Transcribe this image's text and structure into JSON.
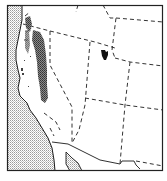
{
  "map": {
    "type": "species range map",
    "region": "Western United States",
    "colors": {
      "frame": "#222222",
      "land": "#ffffff",
      "ocean_stipple": "#9a9a9a",
      "state_border": "#333333",
      "coastline": "#1a1a1a",
      "range_fill": "#555555",
      "range_isolated": "#111111"
    },
    "legend": []
  }
}
